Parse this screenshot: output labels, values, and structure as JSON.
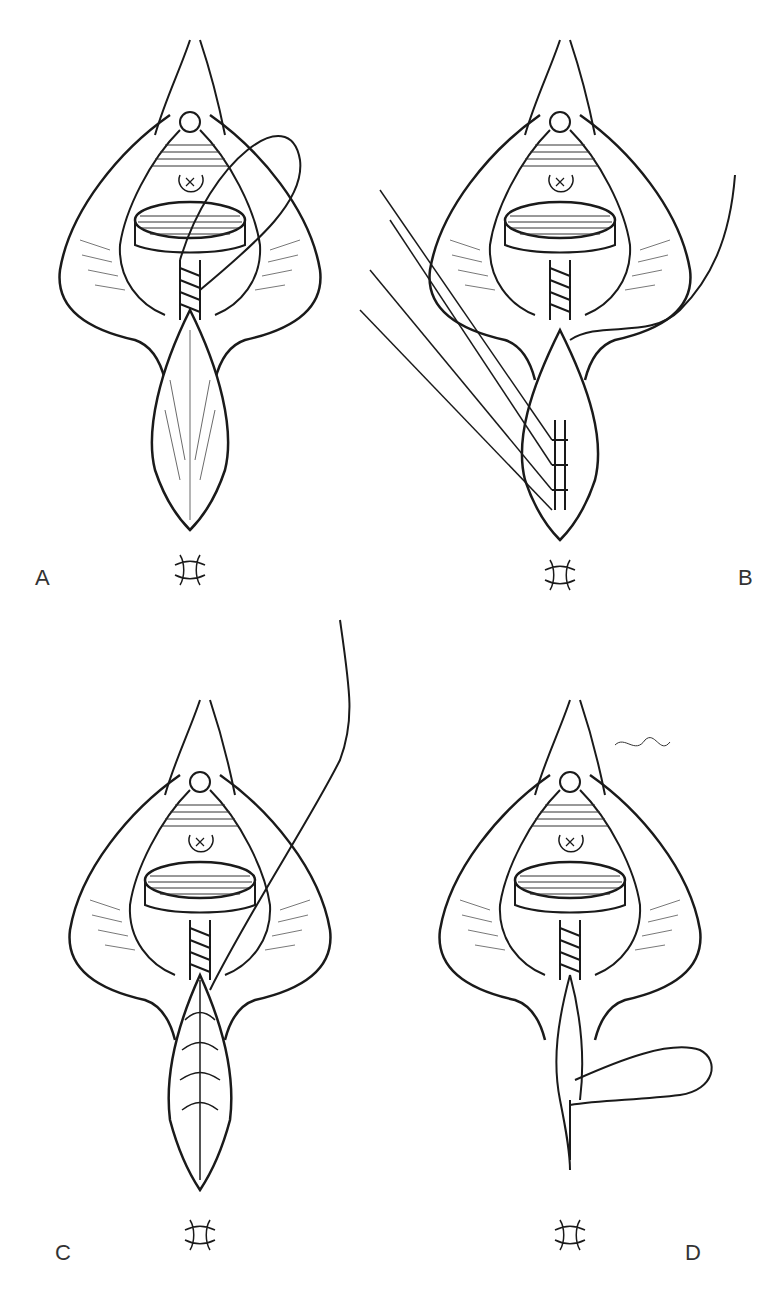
{
  "figure": {
    "panels": [
      {
        "label": "A",
        "description": "Perineal repair: vaginal mucosa closure with continuous suture, loop of suture thread over right labium"
      },
      {
        "label": "B",
        "description": "Interrupted sutures placed in perineal muscle with long thread ends, continuous suture trailing to right"
      },
      {
        "label": "C",
        "description": "Perineal muscle layer closed, continuous suture thread extending upward to right"
      },
      {
        "label": "D",
        "description": "Subcuticular skin closure with suture loop to the right"
      }
    ]
  },
  "colors": {
    "line": "#1a1a1a",
    "background": "#ffffff",
    "label": "#333333"
  }
}
